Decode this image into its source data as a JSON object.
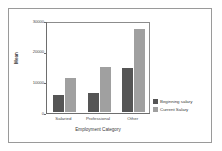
{
  "chart_data": {
    "type": "bar",
    "title": "",
    "xlabel": "Employment Category",
    "ylabel": "Mean",
    "categories": [
      "Salaried",
      "Professional",
      "Other"
    ],
    "series": [
      {
        "name": "Beginning salary",
        "color": "#555555",
        "values": [
          5400,
          6100,
          14500
        ]
      },
      {
        "name": "Current Salary",
        "color": "#a0a0a0",
        "values": [
          11200,
          14700,
          27200
        ]
      }
    ],
    "ylim": [
      0,
      30000
    ],
    "yticks": [
      0,
      10000,
      20000,
      30000
    ],
    "ytick_labels": [
      "0",
      "10000",
      "20000",
      "30000"
    ],
    "grid": false,
    "legend_position": "right"
  },
  "legend": {
    "items": [
      {
        "label": "Beginning salary",
        "color": "#555555"
      },
      {
        "label": "Current Salary",
        "color": "#a0a0a0"
      }
    ]
  },
  "axes": {
    "y_title": "Mean",
    "x_title": "Employment Category"
  }
}
